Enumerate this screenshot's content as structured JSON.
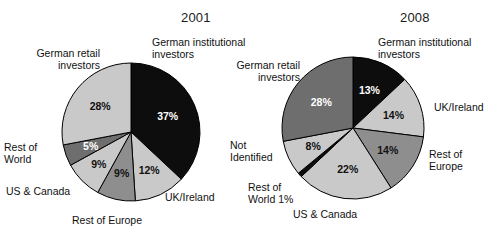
{
  "chart_data": [
    {
      "type": "pie",
      "title": "2001",
      "categories": [
        "German institutional investors",
        "UK/Ireland",
        "Rest of Europe",
        "US & Canada",
        "Rest of World",
        "German retail investors"
      ],
      "values": [
        37,
        12,
        9,
        9,
        5,
        28
      ],
      "data_labels": [
        "37%",
        "12%",
        "9%",
        "9%",
        "5%",
        "28%"
      ],
      "colors": [
        "#0d0d0d",
        "#c9c9c9",
        "#8e8e8e",
        "#c9c9c9",
        "#6e6e6e",
        "#c9c9c9"
      ],
      "start_angle_deg": 0,
      "legend": "callout-labels",
      "grid": false
    },
    {
      "type": "pie",
      "title": "2008",
      "categories": [
        "German institutional investors",
        "UK/Ireland",
        "Rest of Europe",
        "US & Canada",
        "Rest of World",
        "Not Identified",
        "German retail investors"
      ],
      "values": [
        13,
        14,
        14,
        22,
        1,
        8,
        28
      ],
      "data_labels": [
        "13%",
        "14%",
        "14%",
        "22%",
        "1%",
        "8%",
        "28%"
      ],
      "colors": [
        "#0d0d0d",
        "#c9c9c9",
        "#8e8e8e",
        "#c9c9c9",
        "#0d0d0d",
        "#c9c9c9",
        "#6e6e6e"
      ],
      "start_angle_deg": 0,
      "legend": "callout-labels",
      "grid": false
    }
  ],
  "chart2001": {
    "title": "2001",
    "slices": [
      {
        "name": "german-institutional-investors",
        "pct": "37%"
      },
      {
        "name": "uk-ireland",
        "pct": "12%"
      },
      {
        "name": "rest-of-europe",
        "pct": "9%"
      },
      {
        "name": "us-canada",
        "pct": "9%"
      },
      {
        "name": "rest-of-world",
        "pct": "5%"
      },
      {
        "name": "german-retail-investors",
        "pct": "28%"
      }
    ],
    "labels": {
      "german_institutional": "German institutional\ninvestors",
      "uk_ireland": "UK/Ireland",
      "rest_of_europe": "Rest of Europe",
      "us_canada": "US & Canada",
      "rest_of_world": "Rest of\nWorld",
      "german_retail": "German retail\ninvestors"
    },
    "values": {
      "german_institutional": "37%",
      "uk_ireland": "12%",
      "rest_of_europe": "9%",
      "us_canada": "9%",
      "rest_of_world": "5%",
      "german_retail": "28%"
    }
  },
  "chart2008": {
    "title": "2008",
    "labels": {
      "german_institutional": "German institutional\ninvestors",
      "uk_ireland": "UK/Ireland",
      "rest_of_europe": "Rest of\nEurope",
      "us_canada": "US & Canada",
      "rest_of_world": "Rest of\nWorld 1%",
      "not_identified": "Not\nIdentified",
      "german_retail": "German retail\ninvestors"
    },
    "values": {
      "german_institutional": "13%",
      "uk_ireland": "14%",
      "rest_of_europe": "14%",
      "us_canada": "22%",
      "not_identified": "8%",
      "german_retail": "28%"
    }
  }
}
